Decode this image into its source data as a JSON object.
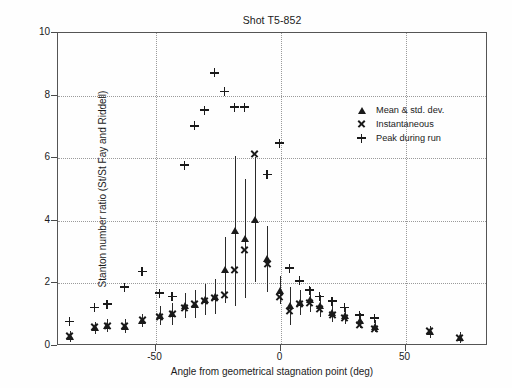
{
  "chart_data": {
    "type": "scatter",
    "title": "Shot T5-852",
    "xlabel": "Angle from geometrical stagnation point (deg)",
    "ylabel": "Stanton number ratio (St/St Fay and Riddell)",
    "xlim": [
      -89,
      83
    ],
    "ylim": [
      0,
      10
    ],
    "xticks": [
      -50,
      0,
      50
    ],
    "yticks": [
      0,
      2,
      4,
      6,
      8,
      10
    ],
    "grid": true,
    "grid_style": "dotted",
    "legend_position": "right-upper",
    "legend": [
      {
        "symbol": "triangle",
        "label": "Mean & std. dev."
      },
      {
        "symbol": "x",
        "label": "Instantaneous"
      },
      {
        "symbol": "plus",
        "label": "Peak during run"
      }
    ],
    "series": [
      {
        "name": "Mean & std. dev.",
        "symbol": "triangle",
        "points": [
          {
            "x": -84,
            "y": 0.28,
            "err": 0.18
          },
          {
            "x": -74,
            "y": 0.55,
            "err": 0.2
          },
          {
            "x": -69,
            "y": 0.62,
            "err": 0.2
          },
          {
            "x": -62,
            "y": 0.6,
            "err": 0.22
          },
          {
            "x": -55,
            "y": 0.78,
            "err": 0.22
          },
          {
            "x": -48,
            "y": 0.95,
            "err": 0.3
          },
          {
            "x": -43,
            "y": 1.0,
            "err": 0.35
          },
          {
            "x": -38,
            "y": 1.25,
            "err": 0.4
          },
          {
            "x": -34,
            "y": 1.3,
            "err": 0.45
          },
          {
            "x": -30,
            "y": 1.45,
            "err": 0.5
          },
          {
            "x": -26,
            "y": 1.55,
            "err": 0.55
          },
          {
            "x": -22,
            "y": 2.4,
            "err": 1.05
          },
          {
            "x": -18,
            "y": 3.65,
            "err": 2.4
          },
          {
            "x": -14,
            "y": 3.4,
            "err": 1.9
          },
          {
            "x": -10,
            "y": 4.0,
            "err": 2.0
          },
          {
            "x": -5,
            "y": 2.75,
            "err": 1.05
          },
          {
            "x": 0,
            "y": 1.75,
            "err": 0.45
          },
          {
            "x": 4,
            "y": 1.25,
            "err": 0.6
          },
          {
            "x": 8,
            "y": 1.35,
            "err": 0.4
          },
          {
            "x": 12,
            "y": 1.45,
            "err": 0.4
          },
          {
            "x": 16,
            "y": 1.25,
            "err": 0.35
          },
          {
            "x": 21,
            "y": 1.05,
            "err": 0.3
          },
          {
            "x": 26,
            "y": 0.95,
            "err": 0.28
          },
          {
            "x": 32,
            "y": 0.78,
            "err": 0.25
          },
          {
            "x": 38,
            "y": 0.6,
            "err": 0.2
          },
          {
            "x": 60,
            "y": 0.42,
            "err": 0.2
          },
          {
            "x": 72,
            "y": 0.25,
            "err": 0.18
          }
        ]
      },
      {
        "name": "Instantaneous",
        "symbol": "x",
        "points": [
          {
            "x": -84,
            "y": 0.3
          },
          {
            "x": -74,
            "y": 0.58
          },
          {
            "x": -69,
            "y": 0.62
          },
          {
            "x": -62,
            "y": 0.62
          },
          {
            "x": -55,
            "y": 0.8
          },
          {
            "x": -48,
            "y": 0.9
          },
          {
            "x": -43,
            "y": 1.0
          },
          {
            "x": -38,
            "y": 1.2
          },
          {
            "x": -34,
            "y": 1.3
          },
          {
            "x": -30,
            "y": 1.4
          },
          {
            "x": -26,
            "y": 1.5
          },
          {
            "x": -22,
            "y": 1.6
          },
          {
            "x": -18,
            "y": 2.4
          },
          {
            "x": -14,
            "y": 3.05
          },
          {
            "x": -10,
            "y": 6.1
          },
          {
            "x": -5,
            "y": 2.6
          },
          {
            "x": 0,
            "y": 1.55
          },
          {
            "x": 4,
            "y": 1.1
          },
          {
            "x": 8,
            "y": 1.3
          },
          {
            "x": 12,
            "y": 1.35
          },
          {
            "x": 16,
            "y": 1.15
          },
          {
            "x": 21,
            "y": 0.95
          },
          {
            "x": 26,
            "y": 0.85
          },
          {
            "x": 32,
            "y": 0.65
          },
          {
            "x": 38,
            "y": 0.52
          },
          {
            "x": 60,
            "y": 0.45
          },
          {
            "x": 72,
            "y": 0.22
          }
        ]
      },
      {
        "name": "Peak during run",
        "symbol": "plus",
        "points": [
          {
            "x": -84,
            "y": 0.75
          },
          {
            "x": -74,
            "y": 1.2
          },
          {
            "x": -69,
            "y": 1.3
          },
          {
            "x": -62,
            "y": 1.85
          },
          {
            "x": -55,
            "y": 2.35
          },
          {
            "x": -48,
            "y": 1.65
          },
          {
            "x": -43,
            "y": 1.55
          },
          {
            "x": -38,
            "y": 5.75
          },
          {
            "x": -34,
            "y": 7.0
          },
          {
            "x": -30,
            "y": 7.5
          },
          {
            "x": -26,
            "y": 8.7
          },
          {
            "x": -22,
            "y": 8.1
          },
          {
            "x": -18,
            "y": 7.6
          },
          {
            "x": -14,
            "y": 7.6
          },
          {
            "x": -5,
            "y": 5.45
          },
          {
            "x": 0,
            "y": 6.45
          },
          {
            "x": 4,
            "y": 2.45
          },
          {
            "x": 8,
            "y": 2.05
          },
          {
            "x": 12,
            "y": 1.75
          },
          {
            "x": 16,
            "y": 1.55
          },
          {
            "x": 21,
            "y": 1.4
          },
          {
            "x": 26,
            "y": 1.2
          },
          {
            "x": 32,
            "y": 0.95
          },
          {
            "x": 38,
            "y": 0.85
          }
        ]
      }
    ]
  }
}
